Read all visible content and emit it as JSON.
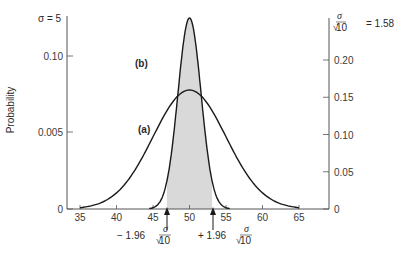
{
  "chart_data": {
    "type": "line",
    "title": "",
    "xlabel": "",
    "ylabel": "Probability",
    "xlim": [
      33,
      68
    ],
    "x_ticks": [
      35,
      40,
      45,
      50,
      55,
      60,
      65
    ],
    "left_axis": {
      "header": "σ = 5",
      "ticks": [
        {
          "value": 0,
          "label": "0"
        },
        {
          "value": 0.05,
          "label": "0.005"
        },
        {
          "value": 0.1,
          "label": "0.10"
        }
      ]
    },
    "right_axis": {
      "header": "σ/√10 = 1.58",
      "header_value": "= 1.58",
      "ticks": [
        {
          "value": 0,
          "label": "0"
        },
        {
          "value": 0.05,
          "label": "0.05"
        },
        {
          "value": 0.1,
          "label": "0.10"
        },
        {
          "value": 0.15,
          "label": "0.15"
        },
        {
          "value": 0.2,
          "label": "0.20"
        }
      ]
    },
    "series": [
      {
        "name": "(a)",
        "label_letter": "a",
        "distribution": "normal",
        "mean": 50,
        "sd": 5,
        "axis": "left",
        "peak": 0.0798
      },
      {
        "name": "(b)",
        "label_letter": "b",
        "distribution": "normal",
        "mean": 50,
        "sd": 1.58,
        "axis": "right",
        "peak": 0.252,
        "shaded_interval": [
          46.9,
          53.1
        ]
      }
    ],
    "annotations": [
      {
        "text": "− 1.96 σ/√10",
        "x": 46.9,
        "arrow": "up"
      },
      {
        "text": "+ 1.96 σ/√10",
        "x": 53.1,
        "arrow": "up"
      }
    ],
    "grid": false,
    "legend": "inline labels (a), (b)"
  },
  "labels": {
    "ylabel": "Probability",
    "sigma_left": "σ = 5",
    "sigma_symbol": "σ",
    "ten": "10",
    "right_value": "= 1.58",
    "curve_a": "a",
    "curve_b": "b",
    "minus_196": "− 1.96",
    "plus_196": "+ 1.96"
  }
}
